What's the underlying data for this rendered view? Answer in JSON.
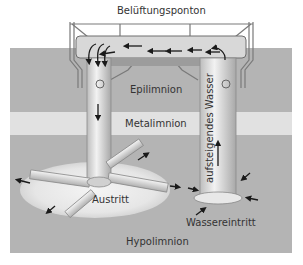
{
  "diagram": {
    "title": "Belüftungsponton",
    "layers": {
      "epilimnion": "Epilimnion",
      "metalimnion": "Metalimnion",
      "hypolimnion": "Hypolimnion"
    },
    "labels": {
      "outlet": "Austritt",
      "inlet": "Wassereintritt",
      "rising_water": "aufsteigendes Wasser"
    },
    "colors": {
      "water": "#b4b4b4",
      "metalimnion_band": "#e6e6e6",
      "pontoon": "#d8d8d8",
      "pipe": "#dcdcdc",
      "glow": "#ececec",
      "arrow": "#1a1a1a"
    }
  }
}
